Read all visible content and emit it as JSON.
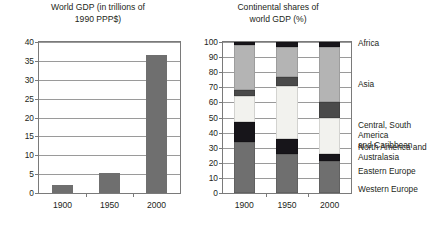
{
  "chart_data": [
    {
      "id": "world-gdp",
      "type": "bar",
      "title": "World GDP (in trillions of\n1990 PPP$)",
      "xlabel": "",
      "ylabel": "",
      "categories": [
        "1900",
        "1950",
        "2000"
      ],
      "values": [
        2.0,
        5.3,
        36.5
      ],
      "ylim": [
        0,
        40
      ],
      "yticks": [
        0,
        5,
        10,
        15,
        20,
        25,
        30,
        35,
        40
      ],
      "ytick_labels": [
        "0",
        "5",
        "10",
        "15",
        "20",
        "25",
        "30",
        "35",
        "40"
      ],
      "grid": true,
      "legend": "none",
      "bar_color": "#6f6f6f"
    },
    {
      "id": "continental-shares",
      "type": "bar",
      "stacked": true,
      "title": "Continental shares of\nworld GDP (%)",
      "xlabel": "",
      "ylabel": "",
      "categories": [
        "1900",
        "1950",
        "2000"
      ],
      "ylim": [
        0,
        100
      ],
      "yticks": [
        0,
        10,
        20,
        30,
        40,
        50,
        60,
        70,
        80,
        90,
        100
      ],
      "ytick_labels": [
        "0",
        "10",
        "20",
        "30",
        "40",
        "50",
        "60",
        "70",
        "80",
        "90",
        "100"
      ],
      "grid": true,
      "legend": "right",
      "series": [
        {
          "name": "Western Europe",
          "values": [
            34,
            26,
            21
          ],
          "color": "#6f6f6f"
        },
        {
          "name": "Eastern Europe",
          "values": [
            13,
            10,
            5
          ],
          "color": "#17151a"
        },
        {
          "name": "North America and\nAustralasia",
          "values": [
            17,
            35,
            24
          ],
          "color": "#f2f2ee"
        },
        {
          "name": "Central, South America\nand Caribbean",
          "values": [
            4,
            6,
            10
          ],
          "color": "#4a4a4a"
        },
        {
          "name": "Asia",
          "values": [
            30,
            20,
            37
          ],
          "color": "#b4b4b4"
        },
        {
          "name": "Africa",
          "values": [
            2,
            3,
            3
          ],
          "color": "#17151a"
        }
      ]
    }
  ],
  "left_chart": {
    "title": "World GDP (in trillions of\n1990 PPP$)",
    "yticks": [
      "40",
      "35",
      "30",
      "25",
      "20",
      "15",
      "10",
      "5",
      "0"
    ],
    "xticks": [
      "1900",
      "1950",
      "2000"
    ]
  },
  "right_chart": {
    "title": "Continental shares of\nworld GDP (%)",
    "yticks": [
      "100",
      "90",
      "80",
      "70",
      "60",
      "50",
      "40",
      "30",
      "20",
      "10",
      "0"
    ],
    "xticks": [
      "1900",
      "1950",
      "2000"
    ],
    "legend": [
      "Africa",
      "Asia",
      "Central, South America\nand Caribbean",
      "North America and\nAustralasia",
      "Eastern Europe",
      "Western Europe"
    ]
  }
}
